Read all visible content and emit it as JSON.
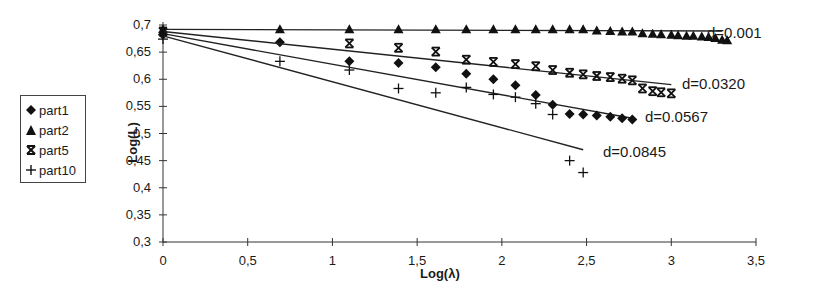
{
  "chart_data": {
    "type": "scatter",
    "title": "",
    "xlabel": "Log(λ)",
    "ylabel": "Log(L)",
    "xlim": [
      0,
      3.5
    ],
    "ylim": [
      0.3,
      0.7
    ],
    "x_ticks": [
      "0",
      "0,5",
      "1",
      "1,5",
      "2",
      "2,5",
      "3",
      "3,5"
    ],
    "y_ticks": [
      "0,3",
      "0,35",
      "0,4",
      "0,45",
      "0,5",
      "0,55",
      "0,6",
      "0,65",
      "0,7"
    ],
    "grid": false,
    "legend_position": "left",
    "series": [
      {
        "name": "part1",
        "marker": "diamond",
        "x": [
          0,
          0.69,
          1.1,
          1.39,
          1.61,
          1.79,
          1.95,
          2.08,
          2.2,
          2.3,
          2.4,
          2.48,
          2.56,
          2.64,
          2.71,
          2.77
        ],
        "y": [
          0.682,
          0.668,
          0.633,
          0.63,
          0.622,
          0.61,
          0.6,
          0.589,
          0.571,
          0.553,
          0.536,
          0.535,
          0.533,
          0.531,
          0.528,
          0.526
        ],
        "trend": {
          "x": [
            0,
            2.77
          ],
          "y": [
            0.684,
            0.528
          ],
          "label": "d=0.0567"
        }
      },
      {
        "name": "part2",
        "marker": "triangle",
        "x": [
          0,
          0.69,
          1.1,
          1.39,
          1.61,
          1.79,
          1.95,
          2.08,
          2.2,
          2.3,
          2.4,
          2.48,
          2.56,
          2.64,
          2.71,
          2.77,
          2.83,
          2.89,
          2.94,
          3.0,
          3.04,
          3.09,
          3.13,
          3.18,
          3.22,
          3.26,
          3.3,
          3.33
        ],
        "y": [
          0.692,
          0.692,
          0.692,
          0.692,
          0.692,
          0.692,
          0.692,
          0.692,
          0.692,
          0.692,
          0.692,
          0.692,
          0.69,
          0.689,
          0.688,
          0.688,
          0.685,
          0.684,
          0.683,
          0.682,
          0.681,
          0.68,
          0.68,
          0.679,
          0.678,
          0.676,
          0.673,
          0.672
        ],
        "trend": {
          "x": [
            0,
            3.3
          ],
          "y": [
            0.692,
            0.689
          ],
          "label": "d=0.001"
        }
      },
      {
        "name": "part5",
        "marker": "asterisk",
        "x": [
          0,
          1.1,
          1.39,
          1.61,
          1.79,
          1.95,
          2.08,
          2.2,
          2.3,
          2.4,
          2.48,
          2.56,
          2.64,
          2.71,
          2.77,
          2.83,
          2.89,
          2.94,
          3.0
        ],
        "y": [
          0.688,
          0.666,
          0.658,
          0.651,
          0.636,
          0.632,
          0.628,
          0.624,
          0.617,
          0.612,
          0.609,
          0.606,
          0.604,
          0.601,
          0.598,
          0.583,
          0.578,
          0.576,
          0.574
        ],
        "trend": {
          "x": [
            0,
            3.0
          ],
          "y": [
            0.688,
            0.59
          ],
          "label": "d=0.0320"
        }
      },
      {
        "name": "part10",
        "marker": "plus",
        "x": [
          0,
          0.69,
          1.1,
          1.39,
          1.61,
          1.79,
          1.95,
          2.08,
          2.2,
          2.3,
          2.4,
          2.48
        ],
        "y": [
          0.674,
          0.633,
          0.617,
          0.583,
          0.575,
          0.585,
          0.572,
          0.567,
          0.555,
          0.535,
          0.45,
          0.428
        ],
        "trend": {
          "x": [
            0,
            2.48
          ],
          "y": [
            0.68,
            0.47
          ],
          "label": "d=0.0845"
        }
      }
    ]
  },
  "legend": [
    {
      "label": "part1",
      "marker": "diamond"
    },
    {
      "label": "part2",
      "marker": "triangle"
    },
    {
      "label": "part5",
      "marker": "asterisk"
    },
    {
      "label": "part10",
      "marker": "plus"
    }
  ],
  "axes": {
    "xlabel": "Log(λ)",
    "ylabel": "Log(L)"
  }
}
